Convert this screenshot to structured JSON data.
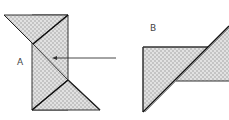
{
  "diagram": {
    "labels": {
      "a": "A",
      "b": "B"
    },
    "colors": {
      "fill_base": "#c8c8c8",
      "fill_dot": "#f4f4f4",
      "stroke": "#222222",
      "label": "#444444"
    },
    "shapes": [
      {
        "id": "A",
        "description": "vertical rectangle with triangular flaps top-left and bottom-right, diagonal fold line"
      },
      {
        "id": "B",
        "description": "horizontal rectangle-triangle composite with diagonal cut"
      }
    ],
    "arrow": {
      "from": "B",
      "to": "A",
      "direction": "left"
    }
  }
}
